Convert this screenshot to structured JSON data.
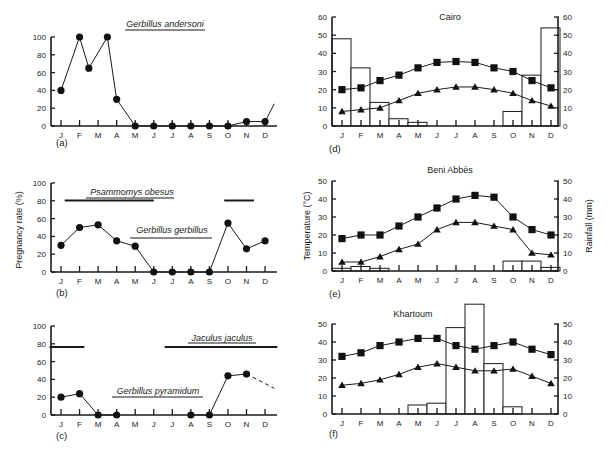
{
  "months": [
    "J",
    "F",
    "M",
    "A",
    "M",
    "J",
    "J",
    "A",
    "S",
    "O",
    "N",
    "D"
  ],
  "chart_data": [
    {
      "id": "a",
      "type": "line",
      "panel_label": "(a)",
      "ylabel": "",
      "ylim": [
        0,
        100
      ],
      "yticks": [
        0,
        20,
        40,
        60,
        80,
        100
      ],
      "species_labels": [
        {
          "name": "Gerbillus andersoni",
          "underline": "single",
          "range_months": null
        }
      ],
      "series": [
        {
          "name": "Gerbillus andersoni",
          "points": [
            {
              "x": 0,
              "y": 40
            },
            {
              "x": 1,
              "y": 100
            },
            {
              "x": 1.5,
              "y": 65
            },
            {
              "x": 2.5,
              "y": 100
            },
            {
              "x": 3,
              "y": 30
            },
            {
              "x": 4,
              "y": 0
            },
            {
              "x": 5,
              "y": 0
            },
            {
              "x": 6,
              "y": 0
            },
            {
              "x": 7,
              "y": 0
            },
            {
              "x": 8,
              "y": 0
            },
            {
              "x": 9,
              "y": 0
            },
            {
              "x": 10,
              "y": 5
            },
            {
              "x": 11,
              "y": 5
            }
          ],
          "tail": {
            "x": 11.5,
            "y": 25,
            "style": "solid"
          }
        }
      ]
    },
    {
      "id": "b",
      "type": "line",
      "panel_label": "(b)",
      "ylabel": "Pregnancy rate (%)",
      "ylim": [
        0,
        100
      ],
      "yticks": [
        0,
        20,
        40,
        60,
        80,
        100
      ],
      "species_labels": [
        {
          "name": "Psammomys obesus",
          "underline": "double",
          "breeding_bars": [
            [
              0.2,
              5.0
            ],
            [
              8.8,
              10.4
            ]
          ]
        },
        {
          "name": "Gerbillus gerbillus",
          "underline": "single"
        }
      ],
      "series": [
        {
          "name": "Gerbillus gerbillus",
          "points": [
            {
              "x": 0,
              "y": 30
            },
            {
              "x": 1,
              "y": 50
            },
            {
              "x": 2,
              "y": 53
            },
            {
              "x": 3,
              "y": 35
            },
            {
              "x": 4,
              "y": 29
            },
            {
              "x": 5,
              "y": 0
            },
            {
              "x": 6,
              "y": 0
            },
            {
              "x": 7,
              "y": 0
            },
            {
              "x": 8,
              "y": 0
            },
            {
              "x": 9,
              "y": 55
            },
            {
              "x": 10,
              "y": 26
            },
            {
              "x": 11,
              "y": 35
            }
          ]
        }
      ]
    },
    {
      "id": "c",
      "type": "line",
      "panel_label": "(c)",
      "ylabel": "",
      "ylim": [
        0,
        100
      ],
      "yticks": [
        0,
        20,
        40,
        60,
        80,
        100
      ],
      "species_labels": [
        {
          "name": "Jaculus jaculus",
          "underline": "single",
          "breeding_bars": [
            [
              -0.4,
              1.1
            ],
            [
              5.8,
              11.5
            ]
          ]
        },
        {
          "name": "Gerbillus pyramidum",
          "underline": "single"
        }
      ],
      "series": [
        {
          "name": "Gerbillus pyramidum",
          "points": [
            {
              "x": 0,
              "y": 20
            },
            {
              "x": 1,
              "y": 24
            },
            {
              "x": 2,
              "y": 0
            },
            {
              "x": 3,
              "y": 0
            },
            {
              "x": 7,
              "y": 0
            },
            {
              "x": 8,
              "y": 0
            },
            {
              "x": 9,
              "y": 44
            },
            {
              "x": 10,
              "y": 46
            }
          ],
          "gap_after_index": 3,
          "tail": {
            "x": 11.5,
            "y": 30,
            "style": "dashed"
          }
        }
      ]
    },
    {
      "id": "d",
      "type": "bar+line",
      "panel_label": "(d)",
      "title": "Cairo",
      "ylabel_left": "",
      "ylabel_right": "",
      "ylim": [
        0,
        60
      ],
      "yticks": [
        0,
        10,
        20,
        30,
        40,
        50,
        60
      ],
      "rainfall_mm": [
        48,
        32,
        13,
        4,
        2,
        0,
        0,
        0,
        0,
        8,
        28,
        54
      ],
      "series": [
        {
          "name": "Mean max temperature",
          "marker": "square",
          "values": [
            20,
            21,
            25,
            28,
            32,
            35,
            35.5,
            35,
            32,
            30,
            25,
            21
          ]
        },
        {
          "name": "Mean min temperature",
          "marker": "triangle",
          "values": [
            8,
            9,
            10,
            14,
            18,
            20,
            21.5,
            21.5,
            20,
            18,
            14,
            11
          ]
        }
      ]
    },
    {
      "id": "e",
      "type": "bar+line",
      "panel_label": "(e)",
      "title": "Beni Abbès",
      "ylabel_left": "Temperature (°C)",
      "ylabel_right": "Rainfall (mm)",
      "ylim": [
        0,
        50
      ],
      "yticks": [
        0,
        10,
        20,
        30,
        40,
        50
      ],
      "rainfall_mm": [
        1.5,
        2.5,
        1.5,
        0,
        0,
        0,
        0,
        0,
        0,
        5.5,
        5.5,
        2
      ],
      "series": [
        {
          "name": "Mean max temperature",
          "marker": "square",
          "values": [
            18,
            20,
            20,
            25,
            30,
            35,
            40,
            42,
            41,
            30,
            23,
            20
          ]
        },
        {
          "name": "Mean min temperature",
          "marker": "triangle",
          "values": [
            5,
            5,
            8,
            12,
            15,
            23,
            27,
            27,
            25,
            23,
            10,
            9
          ]
        }
      ]
    },
    {
      "id": "f",
      "type": "bar+line",
      "panel_label": "(f)",
      "title": "Khartoum",
      "ylabel_left": "",
      "ylabel_right": "",
      "ylim": [
        0,
        50
      ],
      "yticks": [
        0,
        10,
        20,
        30,
        40,
        50
      ],
      "rainfall_mm": [
        0,
        0,
        0,
        0,
        5,
        6,
        48,
        61,
        28,
        4,
        0,
        0
      ],
      "series": [
        {
          "name": "Mean max temperature",
          "marker": "square",
          "values": [
            32,
            34,
            38,
            40,
            42,
            42,
            38,
            36,
            38,
            40,
            36,
            33
          ]
        },
        {
          "name": "Mean min temperature",
          "marker": "triangle",
          "values": [
            16,
            17,
            19,
            22,
            26,
            28,
            26,
            24,
            24,
            25,
            21,
            17
          ]
        }
      ]
    }
  ]
}
